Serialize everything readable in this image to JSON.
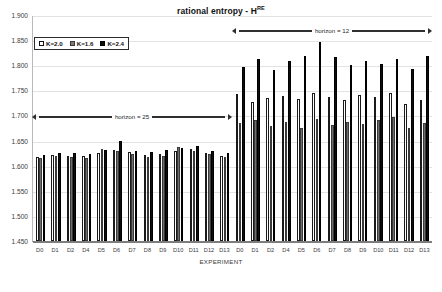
{
  "chart_data": {
    "type": "bar",
    "title": "rational entropy - H",
    "title_superscript": "RE",
    "xlabel": "EXPERIMENT",
    "ylabel": "",
    "ylim": [
      1.45,
      1.9
    ],
    "ytick_step": 0.05,
    "grid": true,
    "legend_position": "top-left",
    "ytick_labels": [
      "1.900",
      "1.850",
      "1.800",
      "1.750",
      "1.700",
      "1.650",
      "1.600",
      "1.550",
      "1.500",
      "1.450"
    ],
    "categories": [
      "D0",
      "D1",
      "D2",
      "D4",
      "D5",
      "D6",
      "D7",
      "D8",
      "D9",
      "D10",
      "D11",
      "D12",
      "D13",
      "D0",
      "D1",
      "D2",
      "D4",
      "D5",
      "D6",
      "D7",
      "D8",
      "D9",
      "D10",
      "D11",
      "D12",
      "D13"
    ],
    "series": [
      {
        "name": "K=2.0",
        "color": "#ffffff",
        "values": [
          1.618,
          1.622,
          1.62,
          1.619,
          1.626,
          1.632,
          1.627,
          1.621,
          1.623,
          1.629,
          1.634,
          1.626,
          1.62,
          1.742,
          1.727,
          1.735,
          1.738,
          1.733,
          1.745,
          1.736,
          1.731,
          1.74,
          1.737,
          1.744,
          1.722,
          1.731
        ]
      },
      {
        "name": "K=1.6",
        "color": "#6f6f6f",
        "values": [
          1.615,
          1.62,
          1.617,
          1.616,
          1.634,
          1.629,
          1.624,
          1.618,
          1.62,
          1.637,
          1.63,
          1.623,
          1.617,
          1.685,
          1.69,
          1.679,
          1.687,
          1.676,
          1.692,
          1.681,
          1.686,
          1.683,
          1.69,
          1.697,
          1.676,
          1.684
        ]
      },
      {
        "name": "K=2.4",
        "color": "#0d0d0d",
        "values": [
          1.622,
          1.625,
          1.626,
          1.624,
          1.631,
          1.65,
          1.63,
          1.628,
          1.632,
          1.636,
          1.639,
          1.63,
          1.626,
          1.797,
          1.812,
          1.79,
          1.808,
          1.819,
          1.846,
          1.816,
          1.8,
          1.809,
          1.802,
          1.812,
          1.793,
          1.818
        ]
      }
    ],
    "annotations": [
      {
        "label": "horizon = 25",
        "start_index": 0,
        "end_index": 12
      },
      {
        "label": "horizon = 12",
        "start_index": 13,
        "end_index": 25
      }
    ]
  },
  "legend": {
    "items": [
      {
        "label": "K=2.0"
      },
      {
        "label": "K=1.6"
      },
      {
        "label": "K=2.4"
      }
    ]
  }
}
